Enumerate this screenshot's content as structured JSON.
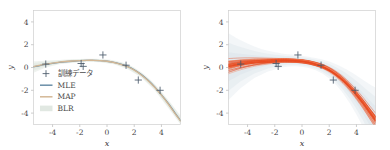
{
  "figure": {
    "background": "#ffffff",
    "panels": [
      "left",
      "right"
    ]
  },
  "colors": {
    "mle_line": "#6b8fa8",
    "map_line": "#d4b896",
    "blr_band": "#dfe7e0",
    "marker": "#4a5a6a",
    "sample_curve": "#e8491f",
    "sample_curve_light": "#f2845c",
    "spine": "#cfcfcf",
    "tick": "#b8b8b8",
    "text": "#4a4a4a"
  },
  "axes": {
    "xlabel": "x",
    "ylabel": "y",
    "xticks": [
      "-4",
      "-2",
      "0",
      "2",
      "4"
    ],
    "xtick_values": [
      -4,
      -2,
      0,
      2,
      4
    ],
    "yticks": [
      "4",
      "2",
      "0",
      "-2",
      "-4"
    ],
    "ytick_values": [
      4,
      2,
      0,
      -2,
      -4
    ],
    "xlim": [
      -5.4,
      5.4
    ],
    "ylim": [
      -5.0,
      5.0
    ],
    "grid": false
  },
  "legend": {
    "location": "lower left",
    "entries": [
      {
        "label": "訓練データ",
        "glyph": "plus-marker",
        "type": "marker"
      },
      {
        "label": "MLE",
        "glyph": "line-swatch",
        "type": "line"
      },
      {
        "label": "MAP",
        "glyph": "line-swatch",
        "type": "line"
      },
      {
        "label": "BLR",
        "glyph": "band-swatch",
        "type": "band"
      }
    ]
  },
  "chart_data": {
    "type": "line",
    "title": "",
    "xlabel": "x",
    "ylabel": "y",
    "xlim": [
      -5.4,
      5.4
    ],
    "ylim": [
      -5.0,
      5.0
    ],
    "grid": false,
    "legend_position": "lower left",
    "panels": [
      {
        "name": "left-panel-mle-map-blr",
        "legend": true,
        "scatter": {
          "name": "訓練データ",
          "marker": "+",
          "x": [
            -4.5,
            -1.9,
            -1.75,
            -0.3,
            1.4,
            2.3,
            3.9
          ],
          "y": [
            0.3,
            0.35,
            0.1,
            1.1,
            0.2,
            -1.1,
            -2.0
          ]
        },
        "series": [
          {
            "name": "MLE",
            "color": "#6b8fa8",
            "x": [
              -5.4,
              -4.5,
              -3.5,
              -2.5,
              -1.5,
              -1.0,
              -0.5,
              0.0,
              0.5,
              1.0,
              1.5,
              2.0,
              2.5,
              3.0,
              3.5,
              4.0,
              4.5,
              5.0,
              5.4
            ],
            "y": [
              0.05,
              0.28,
              0.45,
              0.55,
              0.62,
              0.62,
              0.6,
              0.55,
              0.45,
              0.3,
              0.1,
              -0.2,
              -0.6,
              -1.1,
              -1.7,
              -2.4,
              -3.15,
              -4.0,
              -4.65
            ]
          },
          {
            "name": "MAP",
            "color": "#d4b896",
            "x": [
              -5.4,
              -4.5,
              -3.5,
              -2.5,
              -1.5,
              -1.0,
              -0.5,
              0.0,
              0.5,
              1.0,
              1.5,
              2.0,
              2.5,
              3.0,
              3.5,
              4.0,
              4.5,
              5.0,
              5.4
            ],
            "y": [
              0.08,
              0.3,
              0.47,
              0.57,
              0.63,
              0.63,
              0.6,
              0.55,
              0.44,
              0.28,
              0.07,
              -0.23,
              -0.63,
              -1.13,
              -1.73,
              -2.43,
              -3.2,
              -4.05,
              -4.7
            ]
          },
          {
            "name": "BLR",
            "color": "#dfe7e0",
            "type": "band",
            "x": [
              -5.4,
              -4.5,
              -3.5,
              -2.5,
              -1.5,
              -0.5,
              0.5,
              1.5,
              2.5,
              3.5,
              4.5,
              5.4
            ],
            "y_upper": [
              0.55,
              0.6,
              0.66,
              0.72,
              0.76,
              0.74,
              0.62,
              0.28,
              -0.4,
              -1.45,
              -2.85,
              -4.2
            ],
            "y_lower": [
              -0.45,
              0.0,
              0.28,
              0.42,
              0.5,
              0.46,
              0.28,
              -0.14,
              -0.86,
              -2.0,
              -3.55,
              -5.0
            ]
          }
        ]
      },
      {
        "name": "right-panel-posterior-samples",
        "legend": false,
        "scatter": {
          "name": "訓練データ",
          "marker": "+",
          "x": [
            -4.5,
            -1.9,
            -1.75,
            -0.3,
            1.4,
            2.3,
            3.9
          ],
          "y": [
            0.3,
            0.35,
            0.1,
            1.1,
            0.2,
            -1.1,
            -2.0
          ]
        },
        "sample_count": 40,
        "series": [
          {
            "name": "posterior sample mean",
            "color": "#e8491f",
            "x": [
              -5.4,
              -4.5,
              -3.5,
              -2.5,
              -1.5,
              -1.0,
              -0.5,
              0.0,
              0.5,
              1.0,
              1.5,
              2.0,
              2.5,
              3.0,
              3.5,
              4.0,
              4.5,
              5.0,
              5.4
            ],
            "y": [
              0.07,
              0.29,
              0.46,
              0.56,
              0.62,
              0.62,
              0.6,
              0.55,
              0.45,
              0.29,
              0.08,
              -0.22,
              -0.62,
              -1.12,
              -1.72,
              -2.42,
              -3.18,
              -4.02,
              -4.68
            ]
          }
        ]
      }
    ]
  }
}
